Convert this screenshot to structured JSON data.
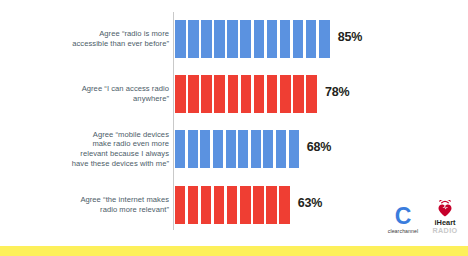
{
  "chart_data": {
    "type": "bar",
    "title": "",
    "subtitle": "",
    "xlabel": "",
    "ylabel": "",
    "orientation": "horizontal",
    "grid": false,
    "legend": "none",
    "xlim": [
      0,
      100
    ],
    "axis_line": true,
    "segments_per_bar": 12,
    "categories": [
      "Agree “radio is more accessible than ever before”",
      "Agree “I can access radio anywhere”",
      "Agree “mobile devices make radio even more relevant because I always have these devices with me”",
      "Agree “the internet makes radio more relevant”"
    ],
    "values": [
      85,
      78,
      68,
      63
    ],
    "value_labels": [
      "85%",
      "78%",
      "68%",
      "63%"
    ],
    "colors": [
      "#5b92e0",
      "#ef3e33",
      "#5b92e0",
      "#ef3e33"
    ]
  },
  "chart": {
    "rows": [
      {
        "label_lines": [
          "Agree “radio is more",
          "accessible than ever before”"
        ],
        "value": 85,
        "value_label": "85%",
        "color": "#5b92e0",
        "segments": 12
      },
      {
        "label_lines": [
          "Agree “I can access radio",
          "anywhere”"
        ],
        "value": 78,
        "value_label": "78%",
        "color": "#ef3e33",
        "segments": 11
      },
      {
        "label_lines": [
          "Agree “mobile devices",
          "make radio even more",
          "relevant because I always",
          "have these devices with me”"
        ],
        "value": 68,
        "value_label": "68%",
        "color": "#5b92e0",
        "segments": 10
      },
      {
        "label_lines": [
          "Agree “the internet makes",
          "radio more relevant”"
        ],
        "value": 63,
        "value_label": "63%",
        "color": "#ef3e33",
        "segments": 9
      }
    ]
  },
  "branding": {
    "clearchannel": {
      "mark": "C",
      "wordmark": "clearchannel",
      "color": "#3b7ddd"
    },
    "iheart": {
      "mark": "iheart-radio-icon",
      "wordmark_top": "iHeart",
      "wordmark_bottom": "RADIO",
      "color": "#c6002b"
    }
  },
  "theme": {
    "background": "#ffffff",
    "label_color": "#4c5c68",
    "value_color": "#231f20",
    "axis_color": "#c9c9c9",
    "accent_blue": "#5b92e0",
    "accent_red": "#ef3e33",
    "band_yellow": "#fdf05a"
  }
}
